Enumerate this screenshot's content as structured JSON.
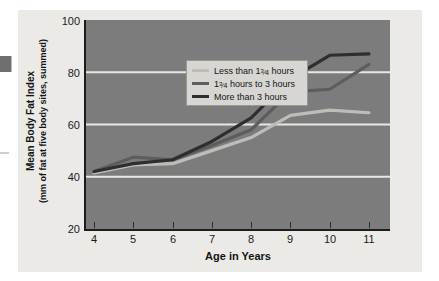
{
  "chart_data": {
    "type": "line",
    "title": "",
    "xlabel": "Age in Years",
    "ylabel_line1": "Mean Body Fat Index",
    "ylabel_line2": "(mm of fat at five body sites, summed)",
    "x": [
      4,
      5,
      6,
      7,
      8,
      9,
      10,
      11
    ],
    "xtick_labels": [
      "4",
      "5",
      "6",
      "7",
      "8",
      "9",
      "10",
      "11"
    ],
    "ytick_labels": [
      "20",
      "40",
      "60",
      "80",
      "100"
    ],
    "yticks": [
      20,
      40,
      60,
      80,
      100
    ],
    "ylim": [
      20,
      100
    ],
    "xlim": [
      4,
      11
    ],
    "grid": "horizontal-only",
    "legend_position": "upper-left-inside",
    "plot_background": "#7c7c7c",
    "gridline_color": "#e8e8e4",
    "series": [
      {
        "name": "Less than 1¾ hours",
        "label_prefix": "Less than 1",
        "label_fraction_num": "3",
        "label_fraction_den": "4",
        "label_suffix": " hours",
        "color": "#bfbdb7",
        "values": [
          41.5,
          44.5,
          45.0,
          50.0,
          55.0,
          63.5,
          65.5,
          64.5
        ]
      },
      {
        "name": "1¾ hours to 3 hours",
        "label_prefix": "1",
        "label_fraction_num": "3",
        "label_fraction_den": "4",
        "label_suffix": " hours to 3 hours",
        "color": "#5d5d5d",
        "values": [
          42.0,
          47.5,
          46.5,
          52.0,
          58.0,
          72.5,
          73.5,
          83.0
        ]
      },
      {
        "name": "More than 3 hours",
        "label_prefix": "More than 3 hours",
        "label_fraction_num": "",
        "label_fraction_den": "",
        "label_suffix": "",
        "color": "#2e2e2e",
        "values": [
          42.0,
          45.0,
          46.5,
          53.5,
          62.5,
          77.5,
          86.5,
          87.0
        ]
      }
    ]
  }
}
